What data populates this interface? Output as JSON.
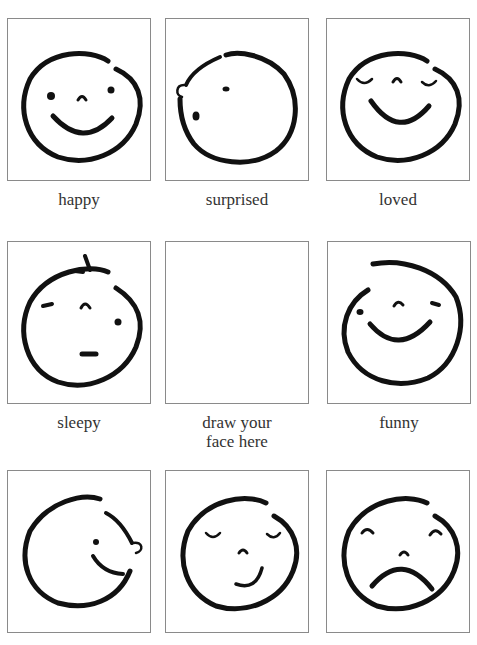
{
  "worksheet": {
    "faces": [
      {
        "label": "happy"
      },
      {
        "label": "surprised"
      },
      {
        "label": "loved"
      },
      {
        "label": "sleepy"
      },
      {
        "label": "draw your face here"
      },
      {
        "label": "funny"
      },
      {
        "label": ""
      },
      {
        "label": ""
      },
      {
        "label": ""
      }
    ],
    "draw_label_line1": "draw your",
    "draw_label_line2": "face here",
    "colors": {
      "ink": "#111111",
      "border": "#8a8a8a",
      "text": "#333333"
    }
  }
}
